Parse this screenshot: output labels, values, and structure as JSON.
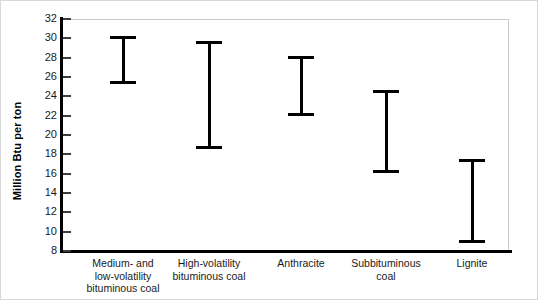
{
  "chart_data": {
    "type": "bar",
    "subtype": "range-interval",
    "title": "",
    "xlabel": "",
    "ylabel": "Million Btu per ton",
    "ylim": [
      8,
      32
    ],
    "ytick_step": 2,
    "yticks": [
      32,
      30,
      28,
      26,
      24,
      22,
      20,
      18,
      16,
      14,
      12,
      10,
      8
    ],
    "ytick_labels": [
      "32",
      "30",
      "28",
      "26",
      "24",
      "22",
      "20",
      "18",
      "16",
      "14",
      "12",
      "10",
      "8"
    ],
    "grid": false,
    "legend": null,
    "categories": [
      "Medium- and\nlow-volatility\nbituminous coal",
      "High-volatility\nbituminous coal",
      "Anthracite",
      "Subbituminous\ncoal",
      "Lignite"
    ],
    "series": [
      {
        "name": "Heat content range",
        "low": [
          25.4,
          18.7,
          22.1,
          16.2,
          9.0
        ],
        "high": [
          30.1,
          29.6,
          28.0,
          24.5,
          17.4
        ]
      }
    ],
    "points": [
      {
        "category": "Medium- and low-volatility bituminous coal",
        "low": 25.4,
        "high": 30.1
      },
      {
        "category": "High-volatility bituminous coal",
        "low": 18.7,
        "high": 29.6
      },
      {
        "category": "Anthracite",
        "low": 22.1,
        "high": 28.0
      },
      {
        "category": "Subbituminous coal",
        "low": 16.2,
        "high": 24.5
      },
      {
        "category": "Lignite",
        "low": 9.0,
        "high": 17.4
      }
    ],
    "colors": {
      "bar": "#000000",
      "axis": "#000000",
      "frame": "#c9c9c9",
      "background": "#ffffff",
      "text": "#1a1a1a"
    }
  },
  "axis": {
    "y_title": "Million Btu per ton"
  },
  "ticks": {
    "y": [
      "32",
      "30",
      "28",
      "26",
      "24",
      "22",
      "20",
      "18",
      "16",
      "14",
      "12",
      "10",
      "8"
    ]
  },
  "categories": {
    "c0": "Medium- and\nlow-volatility\nbituminous coal",
    "c1": "High-volatility\nbituminous coal",
    "c2": "Anthracite",
    "c3": "Subbituminous\ncoal",
    "c4": "Lignite"
  }
}
